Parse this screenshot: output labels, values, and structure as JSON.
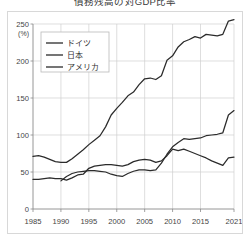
{
  "chart_data": {
    "type": "line",
    "title": "債務残高の対GDP比率",
    "xlabel": "",
    "ylabel": "(%)",
    "unit": "(%)",
    "grid": true,
    "legend_position": "top-left",
    "xlim": [
      1985,
      2021
    ],
    "ylim": [
      0,
      250
    ],
    "xticks": [
      "1985",
      "1990",
      "1995",
      "2000",
      "2005",
      "2010",
      "2015",
      "2021"
    ],
    "xtick_values": [
      1985,
      1990,
      1995,
      2000,
      2005,
      2010,
      2015,
      2021
    ],
    "yticks": [
      "0",
      "50",
      "100",
      "150",
      "200",
      "250"
    ],
    "ytick_values": [
      0,
      50,
      100,
      150,
      200,
      250
    ],
    "series": [
      {
        "name": "ドイツ",
        "color": "#2b2b2b",
        "x": [
          1985,
          1986,
          1987,
          1988,
          1989,
          1990,
          1991,
          1992,
          1993,
          1994,
          1995,
          1996,
          1997,
          1998,
          1999,
          2000,
          2001,
          2002,
          2003,
          2004,
          2005,
          2006,
          2007,
          2008,
          2009,
          2010,
          2011,
          2012,
          2013,
          2014,
          2015,
          2016,
          2017,
          2018,
          2019,
          2020,
          2021
        ],
        "values": [
          40,
          40,
          41,
          42,
          41,
          41,
          39,
          42,
          46,
          47,
          55,
          58,
          59,
          60,
          60,
          59,
          58,
          60,
          64,
          66,
          67,
          66,
          63,
          65,
          72,
          81,
          79,
          81,
          78,
          75,
          72,
          69,
          65,
          62,
          59,
          69,
          70
        ]
      },
      {
        "name": "日本",
        "color": "#2b2b2b",
        "x": [
          1985,
          1986,
          1987,
          1988,
          1989,
          1990,
          1991,
          1992,
          1993,
          1994,
          1995,
          1996,
          1997,
          1998,
          1999,
          2000,
          2001,
          2002,
          2003,
          2004,
          2005,
          2006,
          2007,
          2008,
          2009,
          2010,
          2011,
          2012,
          2013,
          2014,
          2015,
          2016,
          2017,
          2018,
          2019,
          2020,
          2021
        ],
        "values": [
          71,
          72,
          70,
          67,
          64,
          63,
          63,
          68,
          74,
          80,
          87,
          93,
          99,
          111,
          127,
          136,
          144,
          153,
          158,
          168,
          176,
          177,
          175,
          180,
          201,
          207,
          219,
          226,
          229,
          233,
          231,
          236,
          235,
          234,
          236,
          254,
          256
        ]
      },
      {
        "name": "アメリカ",
        "color": "#2b2b2b",
        "x": [
          1990,
          1991,
          1992,
          1993,
          1994,
          1995,
          1996,
          1997,
          1998,
          1999,
          2000,
          2001,
          2002,
          2003,
          2004,
          2005,
          2006,
          2007,
          2008,
          2009,
          2010,
          2011,
          2012,
          2013,
          2014,
          2015,
          2016,
          2017,
          2018,
          2019,
          2020,
          2021
        ],
        "values": [
          38,
          44,
          48,
          50,
          51,
          52,
          52,
          51,
          50,
          47,
          45,
          44,
          48,
          51,
          53,
          53,
          52,
          53,
          62,
          74,
          84,
          90,
          95,
          94,
          95,
          96,
          99,
          100,
          101,
          103,
          127,
          133
        ]
      }
    ],
    "legend": [
      {
        "label": "ドイツ",
        "color": "#2b2b2b"
      },
      {
        "label": "日本",
        "color": "#2b2b2b"
      },
      {
        "label": "アメリカ",
        "color": "#2b2b2b"
      }
    ]
  },
  "style": {
    "grid_color": "#d0d0d0",
    "axis_color": "#8a8a8a",
    "frame_color": "#d8d8d8",
    "line_color": "#2b2b2b",
    "background": "#ffffff"
  }
}
